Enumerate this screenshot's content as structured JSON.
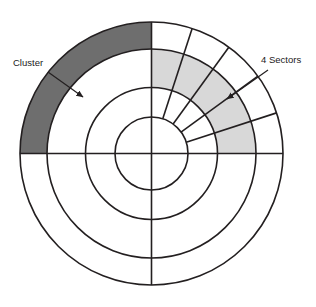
{
  "figure": {
    "background_color": "#ffffff",
    "stroke_color": "#231f20",
    "cluster_fill": "#6e6e6e",
    "sector_fill": "#d8d8d8",
    "center": {
      "x": 151.5,
      "y": 153.5
    },
    "rings": [
      {
        "name": "outer-circle",
        "radius": 131.5
      },
      {
        "name": "ring-2-circle",
        "radius": 104.5
      },
      {
        "name": "ring-3-circle",
        "radius": 66.0
      },
      {
        "name": "inner-circle",
        "radius": 36.5
      }
    ],
    "quadrant_lines": [
      {
        "name": "vertical-axis",
        "angle_deg": 90
      },
      {
        "name": "horizontal-axis",
        "angle_deg": 0
      }
    ],
    "sector_dividers_deg": [
      18,
      36,
      54,
      72
    ],
    "sector_count": 4
  },
  "annotations": [
    {
      "id": "cluster",
      "label": "Cluster",
      "text_x": 13,
      "text_y": 66,
      "leader": {
        "x1": 48,
        "y1": 72,
        "x2": 83,
        "y2": 97
      },
      "target": "dark-cluster-band"
    },
    {
      "id": "sectors",
      "label": "4 Sectors",
      "text_x": 261,
      "text_y": 63,
      "leader": {
        "x1": 268,
        "y1": 70,
        "x2": 225,
        "y2": 100
      },
      "target": "light-sector-band"
    }
  ],
  "regions": {
    "dark_cluster_band": {
      "name": "Cluster",
      "fill": "#6e6e6e",
      "ring": "between outer-circle and ring-2-circle",
      "start_angle_deg": 90,
      "end_angle_deg": 180
    },
    "light_sector_band": {
      "name": "4 Sectors",
      "fill": "#d8d8d8",
      "ring": "between ring-2-circle and ring-3-circle",
      "start_angle_deg": 0,
      "end_angle_deg": 90
    }
  }
}
